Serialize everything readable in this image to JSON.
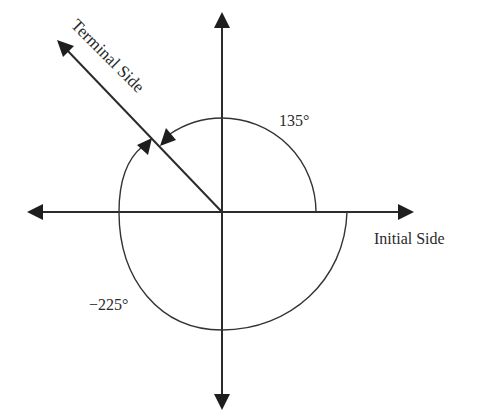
{
  "diagram": {
    "type": "angle-diagram",
    "colors": {
      "stroke": "#2b2b2b",
      "background": "#ffffff"
    },
    "axes": {
      "horizontal": {
        "label": "Initial Side",
        "arrows": "both"
      },
      "vertical": {
        "label": "",
        "arrows": "both"
      }
    },
    "terminal_side": {
      "label": "Terminal Side",
      "angle_deg": 135
    },
    "angles": [
      {
        "label": "135°",
        "value": 135,
        "direction": "counterclockwise"
      },
      {
        "label": "−225°",
        "value": -225,
        "direction": "clockwise"
      }
    ]
  }
}
